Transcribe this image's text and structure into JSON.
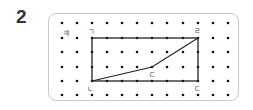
{
  "problem": {
    "number": "2"
  },
  "example_label": "예",
  "grid": {
    "columns_x": [
      62,
      77,
      92,
      107,
      122,
      137,
      152,
      167,
      183,
      198,
      213,
      228
    ],
    "rows_y": [
      23,
      38,
      52,
      67,
      81,
      95
    ],
    "dot_color": "#111111"
  },
  "labels": {
    "a": "ㄱ",
    "b": "ㄴ",
    "c": "ㄷ",
    "d": "ㄹ",
    "e": "ㄷ"
  },
  "shape": {
    "rectangle": {
      "x1": 92,
      "y1": 38,
      "x2": 198,
      "y2": 81
    },
    "diagonal_path": [
      [
        92,
        81
      ],
      [
        152,
        67
      ],
      [
        198,
        38
      ]
    ],
    "line_color": "#222222"
  }
}
